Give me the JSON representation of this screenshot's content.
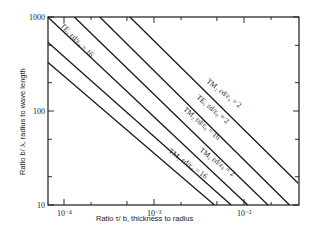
{
  "chart_data": {
    "type": "line",
    "title": "",
    "xlabel": "Ratio τ/ b,  thickness to radius",
    "ylabel": "Ratio b/ λ,  radius to wave length",
    "xscale": "log",
    "yscale": "log",
    "xlim": [
      6.6e-05,
      0.04
    ],
    "ylim": [
      10,
      1000
    ],
    "grid": false,
    "x_ticks": [
      {
        "value": 0.0001,
        "label": "10⁻⁴"
      },
      {
        "value": 0.001,
        "label": "10⁻³"
      },
      {
        "value": 0.01,
        "label": "10⁻²"
      }
    ],
    "y_ticks": [
      {
        "value": 10,
        "label": "10"
      },
      {
        "value": 100,
        "label": "100"
      },
      {
        "value": 1000,
        "label": "1000"
      }
    ],
    "series": [
      {
        "name": "TM₂ εd/ε₀ = 2",
        "mode": "TM",
        "sub": "2",
        "eps": "2",
        "x": [
          0.00054,
          0.04
        ],
        "y": [
          1000,
          17
        ]
      },
      {
        "name": "TE₁ εd/ε₀ = 2",
        "mode": "TE",
        "sub": "1",
        "eps": "2",
        "x": [
          0.00025,
          0.032
        ],
        "y": [
          1000,
          10
        ]
      },
      {
        "name": "TM₂ εd/ε₀ = 16",
        "mode": "TM",
        "sub": "2",
        "eps": "16",
        "x": [
          0.00013,
          0.0185
        ],
        "y": [
          1000,
          10
        ]
      },
      {
        "name": "TE₁ εd/ε₀ = 16",
        "mode": "TE",
        "sub": "1",
        "eps": "16",
        "x": [
          6.6e-05,
          0.011
        ],
        "y": [
          1000,
          10
        ]
      },
      {
        "name": "TM₁ εd/ε₀ = 2",
        "mode": "TM",
        "sub": "1",
        "eps": "2",
        "x": [
          6.6e-05,
          0.0072
        ],
        "y": [
          540,
          10
        ]
      },
      {
        "name": "TM₁ εd/ε₀ = 16",
        "mode": "TM",
        "sub": "1",
        "eps": "16",
        "x": [
          6.6e-05,
          0.0047
        ],
        "y": [
          330,
          10
        ]
      }
    ],
    "annotations": [
      {
        "text": "TE₁ εd/ε₀ = 16",
        "x_px": 60,
        "y_px": 26,
        "angle": 46
      },
      {
        "text": "TM₂ εd/ε₀ = 2",
        "x_px": 206,
        "y_px": 82,
        "angle": 38
      },
      {
        "text": "TE₁ εd/ε₀ = 2",
        "x_px": 196,
        "y_px": 98,
        "angle": 40
      },
      {
        "text": "TM₂ εd/ε₀ = 16",
        "x_px": 183,
        "y_px": 110,
        "angle": 41
      },
      {
        "text": "TM₁ εd/ε₀ = 2",
        "x_px": 199,
        "y_px": 151,
        "angle": 37
      },
      {
        "text": "TM₁ εd/ε₀ = 16",
        "x_px": 168,
        "y_px": 152,
        "angle": 36
      }
    ]
  },
  "layout": {
    "plot": {
      "left": 48,
      "right": 299,
      "top": 17,
      "bottom": 205
    },
    "x_decade_px": 90,
    "x_ref_px": 154,
    "x_ref_log": -3,
    "y_decade_px": 94,
    "y_ref_px": 17,
    "y_ref_log": 3,
    "line_color": "#1a1a1a"
  }
}
